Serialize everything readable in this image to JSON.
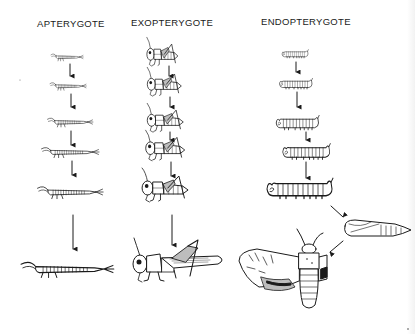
{
  "diagram": {
    "columns": [
      {
        "heading": "APTERYGOTE",
        "stages": [
          "juvenile 1",
          "juvenile 2",
          "juvenile 3",
          "juvenile 4",
          "juvenile 5",
          "adult"
        ],
        "description": "Ametabolous development: young resemble small adults, no wings"
      },
      {
        "heading": "EXOPTERYGOTE",
        "stages": [
          "nymph 1",
          "nymph 2",
          "nymph 3",
          "nymph 4",
          "nymph 5",
          "adult"
        ],
        "description": "Hemimetabolous development: nymphs gradually develop external wing pads"
      },
      {
        "heading": "ENDOPTERYGOTE",
        "stages": [
          "larva 1",
          "larva 2",
          "larva 3",
          "larva 4",
          "larva 5",
          "pupa",
          "adult"
        ],
        "description": "Holometabolous development: larva, pupa, then winged adult"
      }
    ]
  }
}
